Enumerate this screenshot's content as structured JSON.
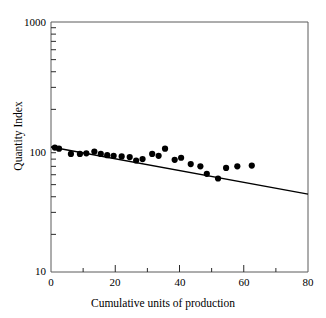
{
  "chart_data": {
    "type": "scatter",
    "title": "",
    "xlabel": "Cumulative units of production",
    "ylabel": "Quantity Index",
    "xlim": [
      0,
      80
    ],
    "ylim": [
      10,
      1000
    ],
    "yscale": "log",
    "grid": false,
    "legend": "none",
    "x_ticks_major": [
      0,
      20,
      40,
      60,
      80
    ],
    "x_tick_labels": [
      "0",
      "20",
      "40",
      "60",
      "80"
    ],
    "x_ticks_minor": [
      10,
      30,
      50,
      70
    ],
    "y_ticks_major": [
      10,
      100,
      1000
    ],
    "y_tick_labels": [
      "10",
      "100",
      "1000"
    ],
    "y_ticks_minor": [
      20,
      30,
      40,
      50,
      60,
      70,
      80,
      90,
      200,
      300,
      400,
      500,
      600,
      700,
      800,
      900
    ],
    "series": [
      {
        "name": "Observed quantity index",
        "type": "scatter",
        "marker": "filled-circle",
        "color": "#000000",
        "points": [
          {
            "x": 1.2,
            "y": 99
          },
          {
            "x": 2.5,
            "y": 97
          },
          {
            "x": 6.2,
            "y": 88
          },
          {
            "x": 9.0,
            "y": 88
          },
          {
            "x": 11.0,
            "y": 89
          },
          {
            "x": 13.5,
            "y": 92
          },
          {
            "x": 15.5,
            "y": 88
          },
          {
            "x": 17.5,
            "y": 86
          },
          {
            "x": 19.5,
            "y": 85
          },
          {
            "x": 22.0,
            "y": 84
          },
          {
            "x": 24.5,
            "y": 83
          },
          {
            "x": 26.5,
            "y": 78
          },
          {
            "x": 28.5,
            "y": 80
          },
          {
            "x": 31.5,
            "y": 88
          },
          {
            "x": 33.5,
            "y": 85
          },
          {
            "x": 35.5,
            "y": 97
          },
          {
            "x": 38.5,
            "y": 79
          },
          {
            "x": 40.5,
            "y": 82
          },
          {
            "x": 43.5,
            "y": 73
          },
          {
            "x": 46.5,
            "y": 70
          },
          {
            "x": 48.5,
            "y": 61
          },
          {
            "x": 52.0,
            "y": 56
          },
          {
            "x": 54.5,
            "y": 68
          },
          {
            "x": 58.0,
            "y": 70
          },
          {
            "x": 62.5,
            "y": 71
          }
        ]
      },
      {
        "name": "Fitted trend line",
        "type": "line",
        "color": "#000000",
        "x": [
          0,
          80
        ],
        "y": [
          100,
          42
        ]
      }
    ]
  },
  "axis": {
    "y_label": "Quantity Index",
    "x_label": "Cumulative units of production"
  }
}
